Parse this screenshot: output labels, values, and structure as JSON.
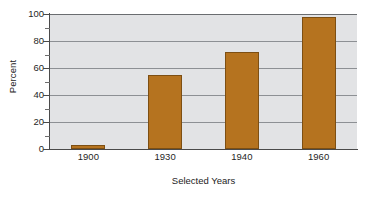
{
  "chart_data": {
    "type": "bar",
    "title": "",
    "subtitle": "",
    "categories": [
      "1900",
      "1930",
      "1940",
      "1960"
    ],
    "values": [
      3,
      55,
      72,
      98
    ],
    "series": [
      {
        "name": "Percent",
        "values": [
          3,
          55,
          72,
          98
        ]
      }
    ],
    "xlabel": "Selected Years",
    "ylabel": "Percent",
    "ylim": [
      0,
      100
    ],
    "y_major_ticks": [
      0,
      20,
      40,
      60,
      80,
      100
    ],
    "y_major_tick_labels": [
      "0",
      "20",
      "40",
      "60",
      "80",
      "100"
    ],
    "y_minor_ticks": [
      10,
      30,
      50,
      70,
      90
    ],
    "grid": true,
    "grid_axis": "y",
    "legend": false,
    "legend_position": "none",
    "annotations": [],
    "colors": {
      "bar_fill": "#b5731f",
      "bar_edge": "#7d4f13",
      "plot_background": "#e2e3e5",
      "gridline": "#8d9094",
      "axis": "#4a4a4a",
      "page_background": "#ffffff",
      "text": "#1f1f1f"
    }
  }
}
